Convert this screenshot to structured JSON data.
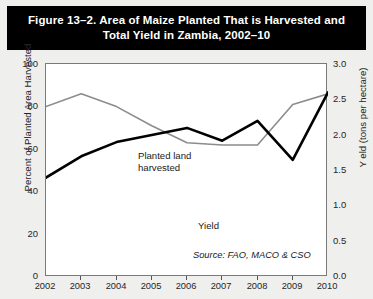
{
  "figure": {
    "title_line1": "Figure 13–2. Area of Maize Planted That is Harvested and",
    "title_line2": "Total Yield in Zambia, 2002–10",
    "source": "Source: FAO, MACO & CSO",
    "banner_color": "#000000",
    "banner_text_color": "#ffffff",
    "page_background": "#efefee"
  },
  "chart_data": {
    "type": "line",
    "title": "Figure 13–2. Area of Maize Planted That is Harvested and Total Yield in Zambia, 2002–10",
    "xlabel": "",
    "x": [
      2002,
      2003,
      2004,
      2005,
      2006,
      2007,
      2008,
      2009,
      2010
    ],
    "xtick_labels": [
      "2002",
      "2003",
      "2004",
      "2005",
      "2006",
      "2007",
      "2008",
      "2009",
      "2010"
    ],
    "xlim": [
      2002,
      2010
    ],
    "grid": false,
    "legend": "inline data labels",
    "axes": [
      {
        "id": "left",
        "label": "Percent of Planted Area Harvested",
        "ylim": [
          0,
          100
        ],
        "yticks": [
          0,
          20,
          40,
          60,
          80,
          100
        ],
        "ytick_labels": [
          "0",
          "20",
          "40",
          "60",
          "80",
          "100"
        ]
      },
      {
        "id": "right",
        "label": "Y eld (tons per hectare)",
        "ylim": [
          0.0,
          3.0
        ],
        "yticks": [
          0.0,
          0.5,
          1.0,
          1.5,
          2.0,
          2.5,
          3.0
        ],
        "ytick_labels": [
          "0.0",
          "0.5",
          "1.0",
          "1.5",
          "2.0",
          "2.5",
          "3.0"
        ]
      }
    ],
    "series": [
      {
        "name": "Planted land harvested",
        "axis": "left",
        "unit": "percent",
        "color": "#8c8c8c",
        "line_width": 1.6,
        "values": [
          80,
          86,
          80,
          71,
          63,
          62,
          62,
          81,
          86
        ]
      },
      {
        "name": "Yield",
        "axis": "right",
        "unit": "tons per hectare",
        "color": "#000000",
        "line_width": 2.6,
        "values": [
          1.4,
          1.7,
          1.9,
          2.0,
          2.1,
          1.92,
          2.2,
          1.65,
          2.6
        ]
      }
    ],
    "annotations": [
      {
        "text": "Planted land",
        "series": "Planted land harvested"
      },
      {
        "text": "harvested",
        "series": "Planted land harvested"
      },
      {
        "text": "Yield",
        "series": "Yield"
      },
      {
        "text": "Source: FAO, MACO & CSO",
        "role": "source"
      }
    ]
  },
  "labels": {
    "planted_line1": "Planted land",
    "planted_line2": "harvested",
    "yield": "Yield"
  }
}
